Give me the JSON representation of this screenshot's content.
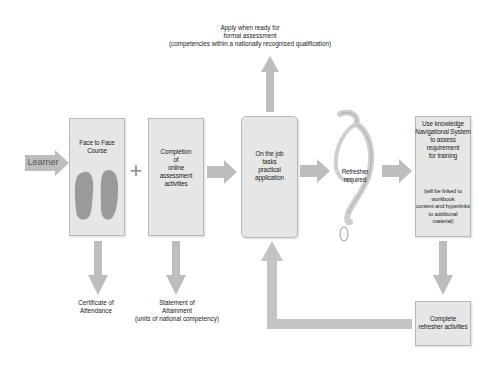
{
  "diagram": {
    "colors": {
      "arrow": "#bdbdbd",
      "box_fill": "#e6e6e6",
      "box_border": "#b9b9b9",
      "text": "#222222"
    },
    "start": {
      "label": "Learner"
    },
    "top_note": {
      "text": "Apply when ready for\nformal assessment\n(competencies within a nationally recognised qualification)"
    },
    "nodes": [
      {
        "id": "face-to-face",
        "label": "Face to Face\nCourse",
        "icon": "footprints-icon"
      },
      {
        "id": "online-assessment",
        "label": "Completion\nof\nonline\nassessment\nactivities"
      },
      {
        "id": "on-the-job",
        "label": "On the job\ntasks\npractical\napplication"
      },
      {
        "id": "refresher-required",
        "label": "Refresher\nrequired",
        "icon": "question-mark-icon"
      },
      {
        "id": "knowledge-nav",
        "label": "Use knowledge\nNavigational System\nto assess\nrequirement\nfor training",
        "sublabel": "(will be linked to\nworkbook\ncontent and  hyperlinks\nto additional\nmaterial)"
      },
      {
        "id": "complete-refresher",
        "label": "Complete\nrefresher activities"
      }
    ],
    "connectors": {
      "plus": "+"
    },
    "outputs": [
      {
        "id": "certificate",
        "label": "Certificate of\nAttendance"
      },
      {
        "id": "statement",
        "label": "Statement of\nAttainment\n(units of national competency)"
      }
    ]
  }
}
